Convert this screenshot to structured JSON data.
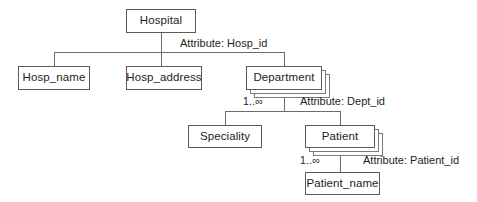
{
  "diagram": {
    "title": "Hospital",
    "type": "hierarchy-tree",
    "nodes": [
      {
        "id": "hospital",
        "label": "Hospital",
        "stacked": false
      },
      {
        "id": "hosp_name",
        "label": "Hosp_name",
        "stacked": false
      },
      {
        "id": "hosp_address",
        "label": "Hosp_address",
        "stacked": false
      },
      {
        "id": "department",
        "label": "Department",
        "stacked": true
      },
      {
        "id": "speciality",
        "label": "Speciality",
        "stacked": false
      },
      {
        "id": "patient",
        "label": "Patient",
        "stacked": true
      },
      {
        "id": "patient_name",
        "label": "Patient_name",
        "stacked": false
      }
    ],
    "annotations": [
      {
        "id": "attr_hosp",
        "text": "Attribute: Hosp_id"
      },
      {
        "id": "attr_dept",
        "text": "Attribute: Dept_id"
      },
      {
        "id": "attr_patient",
        "text": "Attribute: Patient_id"
      }
    ],
    "multiplicities": [
      {
        "id": "mult_dept",
        "text": "1..∞"
      },
      {
        "id": "mult_patient",
        "text": "1..∞"
      }
    ],
    "colors": {
      "background": "#ffffff",
      "box_border": "#5a5a5a",
      "stack_border": "#7a7a7a",
      "connector": "#6b6b6b",
      "text": "#1d1d1d"
    }
  }
}
